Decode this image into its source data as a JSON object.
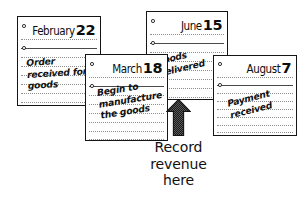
{
  "figure": {
    "type": "calendar-timeline-illustration",
    "caption": {
      "lines": [
        "Record",
        "revenue",
        "here"
      ]
    },
    "arrow": {
      "icon": "up-arrow-icon",
      "direction": "up",
      "points_to": "June 15 — Goods delivered"
    }
  },
  "pages": [
    {
      "id": "february",
      "month": "February",
      "day": "22",
      "note_lines": [
        "Order",
        "received for",
        "goods"
      ]
    },
    {
      "id": "march",
      "month": "March",
      "day": "18",
      "note_lines": [
        "Begin to",
        "manufacture",
        "the goods"
      ]
    },
    {
      "id": "june",
      "month": "June",
      "day": "15",
      "note_lines": [
        "Goods",
        "delivered"
      ]
    },
    {
      "id": "august",
      "month": "August",
      "day": "7",
      "note_lines": [
        "Payment",
        "received"
      ]
    }
  ],
  "colors": {
    "ink": "#111111",
    "paper": "#ffffff",
    "rule": "#8e8e8e",
    "arrow": "#3a3a3a"
  }
}
